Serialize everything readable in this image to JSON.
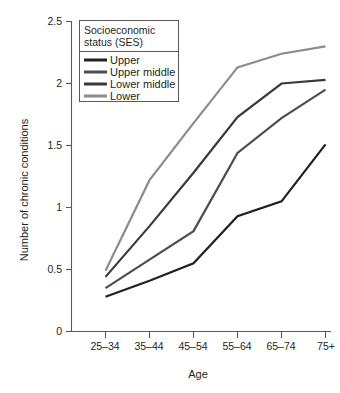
{
  "chart_data": {
    "type": "line",
    "title": "",
    "xlabel": "Age",
    "ylabel": "Number of chronic conditions",
    "categories": [
      "25–34",
      "35–44",
      "45–54",
      "55–64",
      "65–74",
      "75+"
    ],
    "ylim": [
      0,
      2.5
    ],
    "yticks": [
      0,
      0.5,
      1,
      1.5,
      2,
      2.5
    ],
    "ytick_labels": [
      "0",
      "0.5",
      "1",
      "1.5",
      "2",
      "2.5"
    ],
    "grid": false,
    "legend_position": "top-left",
    "legend_title": "Socioeconomic status (SES)",
    "series": [
      {
        "name": "Upper",
        "color": "#231f20",
        "values": [
          0.28,
          0.41,
          0.55,
          0.93,
          1.05,
          1.51
        ]
      },
      {
        "name": "Upper middle",
        "color": "#4d4d4d",
        "values": [
          0.35,
          0.58,
          0.81,
          1.44,
          1.72,
          1.95
        ]
      },
      {
        "name": "Lower middle",
        "color": "#3a3a3a",
        "values": [
          0.44,
          0.85,
          1.28,
          1.73,
          2.0,
          2.03
        ]
      },
      {
        "name": "Lower",
        "color": "#8c8c8c",
        "values": [
          0.49,
          1.22,
          1.68,
          2.13,
          2.24,
          2.3
        ]
      }
    ]
  },
  "legend": {
    "title_line_1": "Socioeconomic",
    "title_line_2": "status (SES)",
    "items": [
      {
        "label": "Upper",
        "color": "#231f20"
      },
      {
        "label": "Upper middle",
        "color": "#4d4d4d"
      },
      {
        "label": "Lower middle",
        "color": "#3a3a3a"
      },
      {
        "label": "Lower",
        "color": "#8c8c8c"
      }
    ]
  },
  "axes": {
    "x_title": "Age",
    "y_title": "Number of chronic conditions",
    "x_labels": [
      "25–34",
      "35–44",
      "45–54",
      "55–64",
      "65–74",
      "75+"
    ],
    "y_labels": [
      "2.5",
      "2",
      "1.5",
      "1",
      "0.5",
      "0"
    ]
  },
  "colors": {
    "axis": "#58595b",
    "text": "#231f20",
    "background": "#ffffff"
  }
}
